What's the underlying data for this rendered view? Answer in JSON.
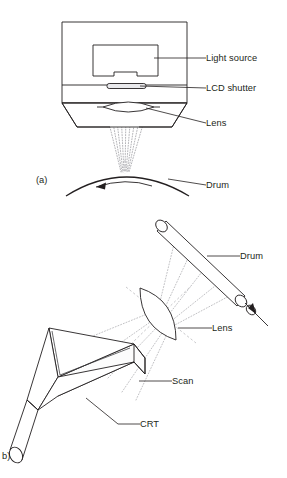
{
  "figure": {
    "panels": [
      {
        "id": "a",
        "caption": "(a)",
        "caption_x": 36,
        "caption_y": 183,
        "description": "LCD shutter print head projecting light through a lens onto a rotating drum",
        "labels": [
          {
            "name": "light-source",
            "text": "Light source",
            "text_x": 206,
            "text_y": 61,
            "leader": "M 206 58 L 154 58"
          },
          {
            "name": "lcd-shutter",
            "text": "LCD shutter",
            "text_x": 206,
            "text_y": 91,
            "leader": "M 206 88 L 140 86"
          },
          {
            "name": "lens",
            "text": "Lens",
            "text_x": 206,
            "text_y": 126,
            "leader": "M 206 123 L 146 108"
          },
          {
            "name": "drum",
            "text": "Drum",
            "text_x": 206,
            "text_y": 188,
            "leader": "M 206 185 L 168 179"
          }
        ]
      },
      {
        "id": "b",
        "caption": "b)",
        "caption_x": 2,
        "caption_y": 459,
        "description": "CRT flying-spot scanner imaging through a lens onto an inclined drum",
        "labels": [
          {
            "name": "drum",
            "text": "Drum",
            "text_x": 240,
            "text_y": 259,
            "leader": "M 240 256 L 207 256"
          },
          {
            "name": "lens",
            "text": "Lens",
            "text_x": 212,
            "text_y": 331,
            "leader": "M 212 328 L 178 328"
          },
          {
            "name": "scan",
            "text": "Scan",
            "text_x": 172,
            "text_y": 384,
            "leader": "M 172 381 L 139 381"
          },
          {
            "name": "crt",
            "text": "CRT",
            "text_x": 140,
            "text_y": 427,
            "leader": "M 140 424 L 118 424 L 86 398"
          }
        ]
      }
    ],
    "colors": {
      "line": "#231f20",
      "ray": "#9b9ba0",
      "background": "#ffffff",
      "shutter_fill": "#e9e9ec"
    }
  }
}
